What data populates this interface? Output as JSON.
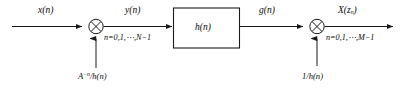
{
  "diagram": {
    "background_color": "#ffffff",
    "line_color": "#1a1a1a",
    "text_color": "#0a0a0a",
    "signals": {
      "input_label": "x(n)",
      "after_first_multiplier_label": "y(n)",
      "after_filter_label": "g(n)",
      "output_label": "X(z",
      "output_label_sub": "n",
      "output_label_tail": ")"
    },
    "index_ranges": {
      "first": "n=0,1,⋯,N−1",
      "second": "n=0,1,⋯,M−1"
    },
    "filter_block": {
      "label": "h(n)"
    },
    "multipliers": [
      {
        "name": "first-multiplier",
        "symbol": "⊗",
        "gain_prefix": "A",
        "gain_exponent": "−n",
        "gain_suffix": "/h(n)"
      },
      {
        "name": "second-multiplier",
        "symbol": "⊗",
        "gain_label": "1/h(n)"
      }
    ]
  }
}
